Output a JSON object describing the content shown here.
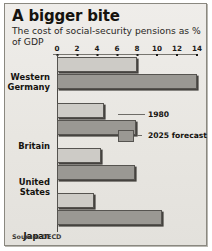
{
  "card": {
    "title": "A bigger bite",
    "subtitle": "The cost of social-security pensions as % of GDP",
    "source": "Source: OECD"
  },
  "legend": {
    "series_1_label": "1980",
    "series_2_label": "2025 forecast"
  },
  "axis": {
    "ticks": [
      "0",
      "2",
      "4",
      "6",
      "8",
      "10",
      "12",
      "14"
    ]
  },
  "countries": {
    "c0_line1": "Western",
    "c0_line2": "Germany",
    "c1_line1": "Britain",
    "c1_line2": "",
    "c2_line1": "United",
    "c2_line2": "States",
    "c3_line1": "Japan",
    "c3_line2": ""
  },
  "colors": {
    "background": "#eceae6",
    "bar_1980": "#cdcbc6",
    "bar_2025": "#9a9893",
    "axis": "#4b4945",
    "text": "#15130f"
  },
  "chart_data": {
    "type": "bar",
    "title": "A bigger bite",
    "subtitle": "The cost of social-security pensions as % of GDP",
    "orientation": "horizontal",
    "categories": [
      "Western Germany",
      "Britain",
      "United States",
      "Japan"
    ],
    "series": [
      {
        "name": "1980",
        "values": [
          8.0,
          4.7,
          4.4,
          3.7
        ]
      },
      {
        "name": "2025 forecast",
        "values": [
          14.0,
          7.9,
          7.8,
          10.5
        ]
      }
    ],
    "xlabel": "% of GDP",
    "ylabel": "",
    "xlim": [
      0,
      14
    ],
    "xticks": [
      0,
      2,
      4,
      6,
      8,
      10,
      12,
      14
    ],
    "grid": false,
    "legend_position": "inside-right",
    "source": "Source: OECD"
  }
}
